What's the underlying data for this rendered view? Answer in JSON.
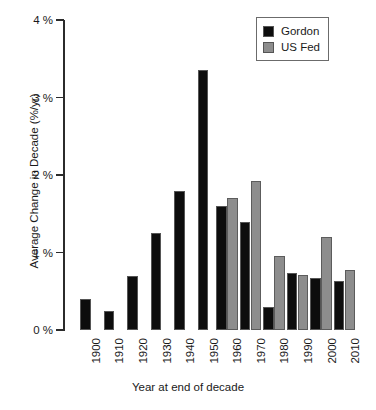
{
  "chart_data": {
    "type": "bar",
    "title": "",
    "subtitle": "",
    "xlabel": "Year at end of decade",
    "ylabel": "Average Change in Decade (%/yr)",
    "categories": [
      "1900",
      "1910",
      "1920",
      "1930",
      "1940",
      "1950",
      "1960",
      "1970",
      "1980",
      "1990",
      "2000",
      "2010"
    ],
    "series": [
      {
        "name": "Gordon",
        "color": "#0d0d0d",
        "values": [
          0.4,
          0.25,
          0.7,
          1.25,
          1.8,
          3.35,
          1.6,
          1.4,
          0.3,
          0.73,
          0.67,
          0.63
        ]
      },
      {
        "name": "US Fed",
        "color": "#8d8d8d",
        "values": [
          null,
          null,
          null,
          null,
          null,
          null,
          1.7,
          1.92,
          0.95,
          0.71,
          1.2,
          0.78
        ]
      }
    ],
    "ylim": [
      0,
      4
    ],
    "ytick_values": [
      0,
      1,
      2,
      3,
      4
    ],
    "ytick_labels": [
      "0 %",
      "1 %",
      "2 %",
      "3 %",
      "4 %"
    ],
    "grid": false,
    "legend_position": "top-right",
    "legend_entries": [
      "Gordon",
      "US Fed"
    ]
  },
  "axes": {
    "y_axis_title": "Average Change in Decade (%/yr)",
    "x_axis_title": "Year at end of decade"
  },
  "legend": {
    "items": [
      {
        "label": "Gordon",
        "swatch": "black-square-icon"
      },
      {
        "label": "US Fed",
        "swatch": "gray-square-icon"
      }
    ]
  }
}
